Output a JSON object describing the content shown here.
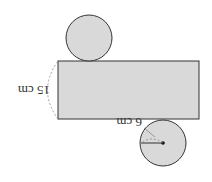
{
  "diagram": {
    "rotation_deg": 180,
    "colors": {
      "fill": "#d9d9d9",
      "stroke": "#333333",
      "dashed": "#888888",
      "background": "#ffffff"
    },
    "shapes": {
      "rectangle": {
        "x": 58,
        "y": 61,
        "width": 141,
        "height": 58
      },
      "top_circle": {
        "cx": 89,
        "cy": 38,
        "r": 23
      },
      "bottom_circle": {
        "cx": 163,
        "cy": 143,
        "r": 23
      }
    },
    "labels": {
      "height": "15 cm",
      "radius": "6 cm"
    }
  }
}
